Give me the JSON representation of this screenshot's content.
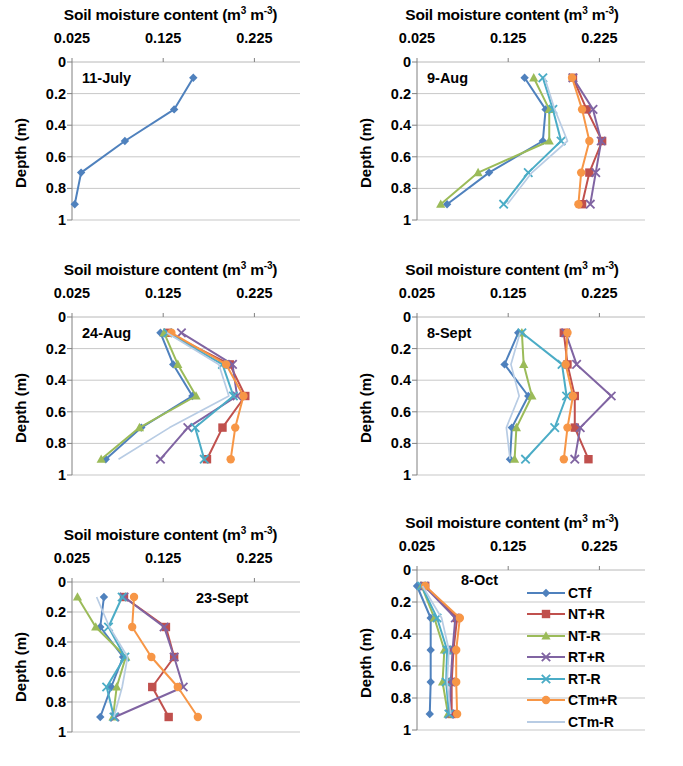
{
  "figure": {
    "axis_title_prefix": "Soil moisture content (m",
    "axis_title_sup1": "3",
    "axis_title_mid": " m",
    "axis_title_sup2": "-3",
    "axis_title_suffix": ")",
    "axis_title_plain": "Soil moisture content (m3 m-3)",
    "ylabel": "Depth (m)",
    "xticks": [
      "0.025",
      "0.125",
      "0.225"
    ],
    "yticks": [
      "0",
      "0.2",
      "0.4",
      "0.6",
      "0.8",
      "1"
    ]
  },
  "legend": {
    "position": "inside-panel-8-oct-right",
    "items": [
      {
        "label": "CTf",
        "color": "#4f81bd",
        "marker": "diamond"
      },
      {
        "label": "NT+R",
        "color": "#c0504d",
        "marker": "square"
      },
      {
        "label": "NT-R",
        "color": "#9bbb59",
        "marker": "triangle"
      },
      {
        "label": "RT+R",
        "color": "#8064a2",
        "marker": "x"
      },
      {
        "label": "RT-R",
        "color": "#4bacc6",
        "marker": "x"
      },
      {
        "label": "CTm+R",
        "color": "#f79646",
        "marker": "circle"
      },
      {
        "label": "CTm-R",
        "color": "#b8cce4",
        "marker": "none"
      }
    ]
  },
  "chart_data": [
    {
      "type": "line",
      "title": "11-July",
      "xlabel": "Soil moisture content (m3 m-3)",
      "ylabel": "Depth (m)",
      "xlim": [
        0.025,
        0.275
      ],
      "ylim": [
        0,
        1
      ],
      "y_inverted": true,
      "grid": true,
      "depths": [
        0.1,
        0.3,
        0.5,
        0.7,
        0.9
      ],
      "series": [
        {
          "name": "CTf",
          "color": "#4f81bd",
          "marker": "diamond",
          "values": [
            0.158,
            0.137,
            0.083,
            0.035,
            0.028
          ]
        }
      ]
    },
    {
      "type": "line",
      "title": "9-Aug",
      "xlabel": "Soil moisture content (m3 m-3)",
      "ylabel": "Depth (m)",
      "xlim": [
        0.025,
        0.275
      ],
      "ylim": [
        0,
        1
      ],
      "y_inverted": true,
      "grid": true,
      "depths": [
        0.1,
        0.3,
        0.5,
        0.7,
        0.9
      ],
      "series": [
        {
          "name": "CTf",
          "color": "#4f81bd",
          "marker": "diamond",
          "values": [
            0.143,
            0.166,
            0.163,
            0.104,
            0.058
          ]
        },
        {
          "name": "NT+R",
          "color": "#c0504d",
          "marker": "square",
          "values": [
            0.196,
            0.211,
            0.228,
            0.214,
            0.206
          ]
        },
        {
          "name": "NT-R",
          "color": "#9bbb59",
          "marker": "triangle",
          "values": [
            0.153,
            0.17,
            0.17,
            0.092,
            0.051
          ]
        },
        {
          "name": "RT+R",
          "color": "#8064a2",
          "marker": "x",
          "values": [
            0.196,
            0.218,
            0.227,
            0.221,
            0.215
          ]
        },
        {
          "name": "RT-R",
          "color": "#4bacc6",
          "marker": "x",
          "values": [
            0.163,
            0.174,
            0.183,
            0.147,
            0.12
          ]
        },
        {
          "name": "CTm+R",
          "color": "#f79646",
          "marker": "circle",
          "values": [
            0.195,
            0.206,
            0.214,
            0.205,
            0.202
          ]
        },
        {
          "name": "CTm-R",
          "color": "#b8cce4",
          "marker": "none",
          "values": [
            0.165,
            0.176,
            0.19,
            0.151,
            0.124
          ]
        }
      ]
    },
    {
      "type": "line",
      "title": "24-Aug",
      "xlabel": "Soil moisture content (m3 m-3)",
      "ylabel": "Depth (m)",
      "xlim": [
        0.025,
        0.275
      ],
      "ylim": [
        0,
        1
      ],
      "y_inverted": true,
      "grid": true,
      "depths": [
        0.1,
        0.3,
        0.5,
        0.7,
        0.9
      ],
      "series": [
        {
          "name": "CTf",
          "color": "#4f81bd",
          "marker": "diamond",
          "values": [
            0.122,
            0.136,
            0.157,
            0.101,
            0.062
          ]
        },
        {
          "name": "NT+R",
          "color": "#c0504d",
          "marker": "square",
          "values": [
            0.13,
            0.198,
            0.215,
            0.19,
            0.173
          ]
        },
        {
          "name": "NT-R",
          "color": "#9bbb59",
          "marker": "triangle",
          "values": [
            0.126,
            0.141,
            0.161,
            0.099,
            0.057
          ]
        },
        {
          "name": "RT+R",
          "color": "#8064a2",
          "marker": "x",
          "values": [
            0.145,
            0.201,
            0.206,
            0.152,
            0.122
          ]
        },
        {
          "name": "RT-R",
          "color": "#4bacc6",
          "marker": "x",
          "values": [
            0.13,
            0.19,
            0.202,
            0.16,
            0.17
          ]
        },
        {
          "name": "CTm+R",
          "color": "#f79646",
          "marker": "circle",
          "values": [
            0.134,
            0.194,
            0.213,
            0.204,
            0.199
          ]
        },
        {
          "name": "CTm-R",
          "color": "#b8cce4",
          "marker": "none",
          "values": [
            0.129,
            0.186,
            0.197,
            0.132,
            0.076
          ]
        }
      ]
    },
    {
      "type": "line",
      "title": "8-Sept",
      "xlabel": "Soil moisture content (m3 m-3)",
      "ylabel": "Depth (m)",
      "xlim": [
        0.025,
        0.275
      ],
      "ylim": [
        0,
        1
      ],
      "y_inverted": true,
      "grid": true,
      "depths": [
        0.1,
        0.3,
        0.5,
        0.7,
        0.9
      ],
      "series": [
        {
          "name": "CTf",
          "color": "#4f81bd",
          "marker": "diamond",
          "values": [
            0.136,
            0.121,
            0.147,
            0.129,
            0.127
          ]
        },
        {
          "name": "NT+R",
          "color": "#c0504d",
          "marker": "square",
          "values": [
            0.186,
            0.19,
            0.198,
            0.198,
            0.213
          ]
        },
        {
          "name": "NT-R",
          "color": "#9bbb59",
          "marker": "triangle",
          "values": [
            0.14,
            0.142,
            0.151,
            0.134,
            0.132
          ]
        },
        {
          "name": "RT+R",
          "color": "#8064a2",
          "marker": "x",
          "values": [
            0.188,
            0.2,
            0.238,
            0.204,
            0.198
          ]
        },
        {
          "name": "RT-R",
          "color": "#4bacc6",
          "marker": "x",
          "values": [
            0.14,
            0.184,
            0.189,
            0.176,
            0.144
          ]
        },
        {
          "name": "CTm+R",
          "color": "#f79646",
          "marker": "circle",
          "values": [
            0.19,
            0.188,
            0.196,
            0.19,
            0.186
          ]
        },
        {
          "name": "CTm-R",
          "color": "#b8cce4",
          "marker": "none",
          "values": [
            0.138,
            0.128,
            0.137,
            0.123,
            0.127
          ]
        }
      ]
    },
    {
      "type": "line",
      "title": "23-Sept",
      "xlabel": "Soil moisture content (m3 m-3)",
      "ylabel": "Depth (m)",
      "xlim": [
        0.025,
        0.275
      ],
      "ylim": [
        0,
        1
      ],
      "y_inverted": true,
      "grid": true,
      "depths": [
        0.1,
        0.3,
        0.5,
        0.7,
        0.9
      ],
      "series": [
        {
          "name": "CTf",
          "color": "#4f81bd",
          "marker": "diamond",
          "values": [
            0.06,
            0.056,
            0.081,
            0.068,
            0.056
          ]
        },
        {
          "name": "NT+R",
          "color": "#c0504d",
          "marker": "square",
          "values": [
            0.082,
            0.128,
            0.137,
            0.113,
            0.131
          ]
        },
        {
          "name": "NT-R",
          "color": "#9bbb59",
          "marker": "triangle",
          "values": [
            0.031,
            0.051,
            0.084,
            0.074,
            0.07
          ]
        },
        {
          "name": "RT+R",
          "color": "#8064a2",
          "marker": "x",
          "values": [
            0.082,
            0.126,
            0.137,
            0.147,
            0.072
          ]
        },
        {
          "name": "RT-R",
          "color": "#4bacc6",
          "marker": "x",
          "values": [
            0.08,
            0.065,
            0.083,
            0.063,
            0.071
          ]
        },
        {
          "name": "CTm+R",
          "color": "#f79646",
          "marker": "circle",
          "values": [
            0.093,
            0.091,
            0.112,
            0.141,
            0.163
          ]
        },
        {
          "name": "CTm-R",
          "color": "#b8cce4",
          "marker": "none",
          "values": [
            0.052,
            0.066,
            0.086,
            0.08,
            0.071
          ]
        }
      ]
    },
    {
      "type": "line",
      "title": "8-Oct",
      "xlabel": "Soil moisture content (m3 m-3)",
      "ylabel": "Depth (m)",
      "xlim": [
        0.025,
        0.275
      ],
      "ylim": [
        0,
        1
      ],
      "y_inverted": true,
      "grid": true,
      "depths": [
        0.1,
        0.3,
        0.5,
        0.7,
        0.9
      ],
      "series": [
        {
          "name": "CTf",
          "color": "#4f81bd",
          "marker": "diamond",
          "values": [
            0.025,
            0.04,
            0.04,
            0.04,
            0.039
          ]
        },
        {
          "name": "NT+R",
          "color": "#c0504d",
          "marker": "square",
          "values": [
            0.034,
            0.069,
            0.065,
            0.063,
            0.063
          ]
        },
        {
          "name": "NT-R",
          "color": "#9bbb59",
          "marker": "triangle",
          "values": [
            0.03,
            0.044,
            0.055,
            0.053,
            0.059
          ]
        },
        {
          "name": "RT+R",
          "color": "#8064a2",
          "marker": "x",
          "values": [
            0.033,
            0.067,
            0.064,
            0.062,
            0.061
          ]
        },
        {
          "name": "RT-R",
          "color": "#4bacc6",
          "marker": "x",
          "values": [
            0.03,
            0.047,
            0.058,
            0.057,
            0.06
          ]
        },
        {
          "name": "CTm+R",
          "color": "#f79646",
          "marker": "circle",
          "values": [
            0.034,
            0.072,
            0.068,
            0.068,
            0.069
          ]
        },
        {
          "name": "CTm-R",
          "color": "#b8cce4",
          "marker": "none",
          "values": [
            0.031,
            0.052,
            0.06,
            0.058,
            0.062
          ]
        }
      ]
    }
  ]
}
